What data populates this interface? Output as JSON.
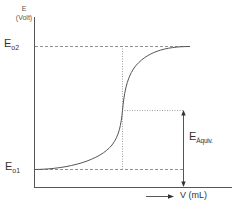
{
  "diagram": {
    "type": "titration-curve",
    "y_axis": {
      "symbol": "E",
      "unit": "(Volt)"
    },
    "x_axis": {
      "label": "V (mL)"
    },
    "levels": {
      "upper": {
        "main": "E",
        "sub": "o2"
      },
      "lower": {
        "main": "E",
        "sub": "o1"
      }
    },
    "equivalence": {
      "main": "E",
      "sub": "Äquiv."
    },
    "colors": {
      "line": "#555555",
      "dashed": "#777777",
      "text": "#333333"
    }
  }
}
